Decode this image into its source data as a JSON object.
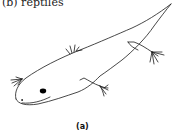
{
  "heading": {
    "text": "(b) reptiles"
  },
  "figure": {
    "stroke_color": "#1a1a1a",
    "eye_color": "#000000"
  },
  "caption": {
    "text": "(a)"
  }
}
